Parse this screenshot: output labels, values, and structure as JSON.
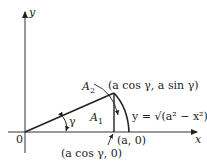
{
  "diagram": {
    "axes": {
      "x_label": "x",
      "y_label": "y",
      "origin_label": "0"
    },
    "angle_label": "γ",
    "region_labels": {
      "A1": "A",
      "A1_sub": "1",
      "A2": "A",
      "A2_sub": "2"
    },
    "points": {
      "top": "(a cos γ, a sin γ)",
      "a0": "(a, 0)",
      "foot": "(a cos γ, 0)"
    },
    "curve_label": "y = √(a² − x²)"
  }
}
